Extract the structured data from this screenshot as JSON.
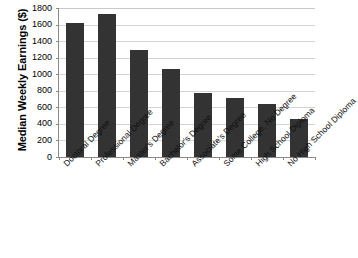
{
  "chart_data": {
    "type": "bar",
    "title": "",
    "subtitle": "",
    "xlabel": "",
    "ylabel": "Median Weekly Earnings ($)",
    "ylim": [
      0,
      1800
    ],
    "ytick_step": 200,
    "yticks": [
      "1800",
      "1600",
      "1400",
      "1200",
      "1000",
      "800",
      "600",
      "400",
      "200",
      "0"
    ],
    "grid": "horizontal",
    "legend": "none",
    "bar_color": "#333333",
    "gridline_color": "#d4d4d4",
    "axis_color": "#8a8a8a",
    "background": "#ffffff",
    "categories": [
      "Doctoral Degree",
      "Professional Degree",
      "Master's Degree",
      "Bachelor's Degree",
      "Associate's Degree",
      "Some College, No Degree",
      "High School Diploma",
      "No High School Diploma"
    ],
    "values": [
      1620,
      1730,
      1290,
      1060,
      775,
      715,
      640,
      455
    ]
  }
}
